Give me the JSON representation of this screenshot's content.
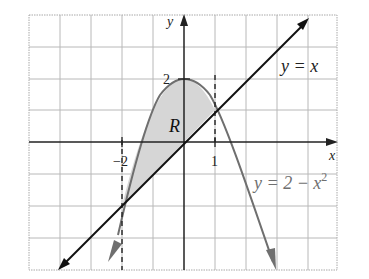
{
  "diagram": {
    "colors": {
      "background": "#ffffff",
      "grid": "#b8b8b8",
      "grid_border": "#a8a8a8",
      "axes": "#222222",
      "line": "#111111",
      "parabola": "#6f6f6f",
      "region_fill": "#d6d6d6",
      "dashed": "#222222"
    },
    "axes": {
      "x_label": "x",
      "y_label": "y",
      "x_range": [
        -5,
        5
      ],
      "y_range": [
        -4,
        4
      ]
    },
    "ticks": {
      "x_neg2": "−2",
      "x_1": "1",
      "y_2": "2"
    },
    "curves": {
      "line_label": "y = x",
      "parabola_label_base": "y = 2 − x",
      "parabola_label_exp": "2"
    },
    "region": {
      "label": "R"
    },
    "intersections": [
      {
        "x": -2,
        "y": -2
      },
      {
        "x": 1,
        "y": 1
      }
    ]
  }
}
